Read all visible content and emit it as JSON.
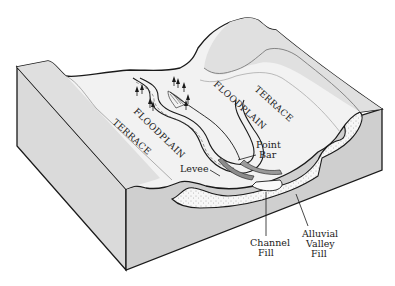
{
  "diagram": {
    "type": "block-diagram",
    "labels": {
      "terrace_left": "TERRACE",
      "floodplain_left": "FLOODPLAIN",
      "floodplain_right": "FLOODPLAIN",
      "terrace_right": "TERRACE",
      "levee": "Levee",
      "point_bar_line1": "Point",
      "point_bar_line2": "Bar",
      "channel_fill_line1": "Channel",
      "channel_fill_line2": "Fill",
      "alluvial_line1": "Alluvial",
      "alluvial_line2": "Valley",
      "alluvial_line3": "Fill"
    },
    "colors": {
      "outline": "#1a1a1a",
      "top_surface": "#f2f2f2",
      "terrace_shade": "#dcdcdc",
      "side_face": "#d9d9d9",
      "front_face": "#cfcfcf",
      "fill_deposit": "#f7f7f7",
      "levee_shade": "#8c8c8c"
    }
  }
}
